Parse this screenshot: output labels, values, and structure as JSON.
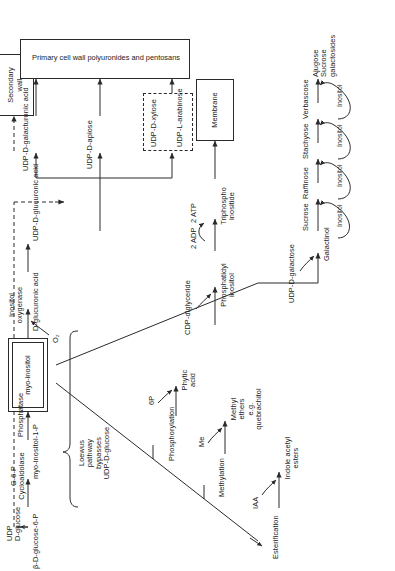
{
  "figure": {
    "type": "biochemical-pathway-diagram",
    "orientation": "rotated-90-ccw"
  },
  "nodes": {
    "udp_d_glucose": "UDP\nD-glucose",
    "beta_d_glucose_6p": "β-D-glucose-6-P",
    "myo_inositol_1p": "myo-inositol-1-P",
    "myo_inositol": "myo-inositol",
    "o2": "O₂",
    "d_glucuronic_acid": "D-glucuronic acid",
    "udp_d_glucuronic_acid": "UDP-D-glucuronic acid",
    "udp_d_apiose": "UDP-D-apiose",
    "udp_d_galacturonic_acid": "UDP-D-galacturonic acid",
    "udp_d_xylose": "UDP-D-xylose",
    "udp_l_arabinose": "UDP-L-arabinose",
    "esterification": "Esterification",
    "iaa": "IAA",
    "indole_acetyl_esters": "Indole acetyl\nesters",
    "methylation": "Methylation",
    "me": "Me",
    "methyl_ethers": "Methyl\nethers\ne.g.\nquebrachitol",
    "phosphorylation": "Phosphorylation",
    "six_p": "6P",
    "phytic_acid": "Phytic\nacid",
    "cdp_diglyceride": "CDP-diglyceride",
    "phosphatidyl_inositol": "Phosphatidyl\ninositol",
    "two_adp": "2 ADP",
    "two_atp": "2 ATP",
    "triphosphoinositide": "Triphospho\ninositide",
    "udp_d_galactose": "UDP-D-galactose",
    "galactinol": "Galactinol",
    "sucrose": "Sucrose",
    "inositol": "Inositol",
    "raffinose": "Raffinose",
    "stachyose": "Stachyose",
    "verbascose": "Verbascose",
    "ajugose_sucrose_galactosides": "Ajugose\nSucrose\ngalactosides"
  },
  "enzymes": {
    "g6p_cycloaldolase": "G-6-P\nCycloaldolase",
    "phosphatase": "Phosphatase",
    "inositol_oxygenase": "Inositol\noxygenase"
  },
  "annotations": {
    "loewus": "Loewus\npathway\nbypasses\nUDP-D-glucose"
  },
  "terminal_boxes": {
    "secondary_wall": "Secondary\nwall",
    "primary_cell_wall": "Primary cell wall polyuronides and pentosans",
    "membrane": "Membrane"
  },
  "colors": {
    "stroke": "#2a2a2a",
    "text": "#1a1a1a",
    "background": "#ffffff"
  }
}
